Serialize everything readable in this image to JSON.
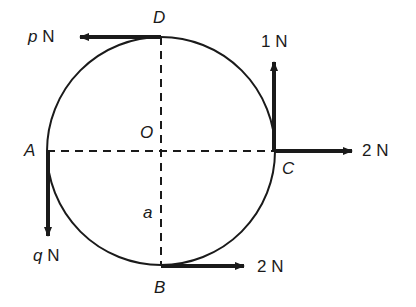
{
  "diagram": {
    "type": "force-diagram",
    "circle": {
      "center_label": "O",
      "radius_label": "a"
    },
    "points": {
      "A": "A",
      "B": "B",
      "C": "C",
      "D": "D"
    },
    "forces": [
      {
        "at": "D",
        "direction": "left",
        "magnitude_var": "p",
        "unit": "N"
      },
      {
        "at": "C",
        "direction": "up",
        "magnitude": "1",
        "unit": "N"
      },
      {
        "at": "C",
        "direction": "right",
        "magnitude": "2",
        "unit": "N"
      },
      {
        "at": "A",
        "direction": "down",
        "magnitude_var": "q",
        "unit": "N"
      },
      {
        "at": "B",
        "direction": "right",
        "magnitude": "2",
        "unit": "N"
      }
    ],
    "colors": {
      "ink": "#1a1a1a",
      "background": "#ffffff"
    }
  }
}
